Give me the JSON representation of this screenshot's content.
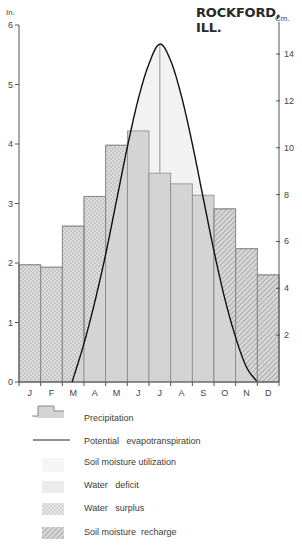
{
  "header": {
    "title": "ROCKFORD, ILL.",
    "left_unit": "In.",
    "right_unit": "Cm."
  },
  "chart_data": {
    "type": "bar",
    "title": "ROCKFORD, ILL.",
    "xlabel": "",
    "ylabel": "In.",
    "ylabel_right": "Cm.",
    "ylim": [
      0,
      6
    ],
    "ylim_right_cm": [
      0,
      15.24
    ],
    "grid": false,
    "legend_position": "bottom",
    "categories": [
      "J",
      "F",
      "M",
      "A",
      "M",
      "J",
      "J",
      "A",
      "S",
      "O",
      "N",
      "D"
    ],
    "yticks_left": [
      0,
      1,
      2,
      3,
      4,
      5,
      6
    ],
    "yticks_right": [
      2,
      4,
      6,
      8,
      10,
      12,
      14
    ],
    "series": [
      {
        "name": "Precipitation",
        "type": "bar",
        "values": [
          1.97,
          1.93,
          2.62,
          3.12,
          3.98,
          4.22,
          3.51,
          3.33,
          3.14,
          2.91,
          2.24,
          1.8
        ]
      },
      {
        "name": "Potential evapotranspiration",
        "type": "line",
        "x": [
          2.45,
          3.0,
          3.5,
          4.0,
          4.5,
          5.0,
          5.5,
          6.0,
          6.5,
          7.0,
          7.5,
          8.0,
          8.5,
          9.0,
          9.5,
          10.0,
          10.5,
          11.0
        ],
        "values": [
          0.0,
          0.65,
          1.35,
          2.15,
          3.05,
          3.95,
          4.75,
          5.35,
          5.68,
          5.4,
          4.8,
          4.0,
          3.1,
          2.2,
          1.4,
          0.75,
          0.25,
          0.0
        ]
      }
    ],
    "regions": [
      {
        "name": "Water surplus",
        "months": [
          "J",
          "F",
          "M",
          "A",
          "M"
        ],
        "pattern": "dots"
      },
      {
        "name": "Soil moisture utilization",
        "months": [
          "J",
          "J",
          "A"
        ],
        "pattern": "light-fill"
      },
      {
        "name": "Water deficit",
        "months": [
          "J",
          "J",
          "A",
          "S",
          "O",
          "N"
        ],
        "pattern": "gray-fill"
      },
      {
        "name": "Soil moisture recharge",
        "months": [
          "S",
          "O",
          "N",
          "D"
        ],
        "pattern": "hatch"
      }
    ]
  },
  "legend": {
    "items": [
      {
        "label": "Precipitation",
        "icon": "precipitation-bar-icon"
      },
      {
        "label": "Potential   evapotranspiration",
        "icon": "line-icon"
      },
      {
        "label": "Soil moisture utilization",
        "icon": "light-fill-icon"
      },
      {
        "label": "Water   deficit",
        "icon": "gray-fill-icon"
      },
      {
        "label": "Water   surplus",
        "icon": "dots-icon"
      },
      {
        "label": "Soil moisture  recharge",
        "icon": "hatch-icon"
      }
    ]
  },
  "colors": {
    "bar_fill": "#d4d4d4",
    "bar_stroke": "#8a8a8a",
    "utilization_fill": "#ececec",
    "axis": "#555555",
    "curve": "#111111",
    "dots": "#8a8a8a",
    "hatch": "#8a8a8a"
  }
}
